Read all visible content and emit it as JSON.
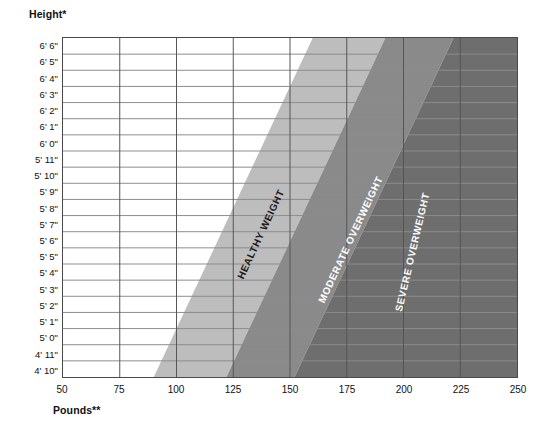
{
  "titles": {
    "height_axis": "Height*",
    "weight_axis": "Pounds**"
  },
  "colors": {
    "healthy_band": "#bdbdbd",
    "moderate_band": "#8a8a8a",
    "severe_band": "#6e6e6e",
    "grid_line": "#8c8c8c",
    "frame": "#4a4a4a",
    "plot_background": "#ffffff",
    "dark_label_text": "#1b1b1b",
    "light_label_text": "#ffffff"
  },
  "chart_data": {
    "type": "area",
    "title": "",
    "subtitle": "",
    "xlabel": "Pounds**",
    "ylabel": "Height*",
    "grid": true,
    "legend_position": "inline-band-labels",
    "xlim": [
      50,
      250
    ],
    "x_ticks": [
      50,
      75,
      100,
      125,
      150,
      175,
      200,
      225,
      250
    ],
    "x_tick_labels": [
      "50",
      "75",
      "100",
      "125",
      "150",
      "175",
      "200",
      "225",
      "250"
    ],
    "x_minor_step": 25,
    "ylim_rows": 21,
    "y_tick_labels": [
      "6' 6\"",
      "6' 5\"",
      "6' 4\"",
      "6' 3\"",
      "6' 2\"",
      "6' 1\"",
      "6' 0\"",
      "5' 11\"",
      "5' 10\"",
      "5' 9\"",
      "5' 8\"",
      "5' 7\"",
      "5' 6\"",
      "5' 5\"",
      "5' 4\"",
      "5' 3\"",
      "5' 2\"",
      "5' 1\"",
      "5' 0\"",
      "4' 11\"",
      "4' 10\""
    ],
    "bands": [
      {
        "name": "HEALTHY WEIGHT",
        "color": "#bdbdbd",
        "text_color": "#1b1b1b",
        "lower_weight_at_top": 160,
        "upper_weight_at_top": 192,
        "lower_weight_at_bottom": 90,
        "upper_weight_at_bottom": 122
      },
      {
        "name": "MODERATE OVERWEIGHT",
        "color": "#8a8a8a",
        "text_color": "#ffffff",
        "lower_weight_at_top": 192,
        "upper_weight_at_top": 222,
        "lower_weight_at_bottom": 122,
        "upper_weight_at_bottom": 152
      },
      {
        "name": "SEVERE OVERWEIGHT",
        "color": "#6e6e6e",
        "text_color": "#ffffff",
        "lower_weight_at_top": 222,
        "upper_weight_at_top": 250,
        "lower_weight_at_bottom": 152,
        "upper_weight_at_bottom": 250
      }
    ]
  }
}
